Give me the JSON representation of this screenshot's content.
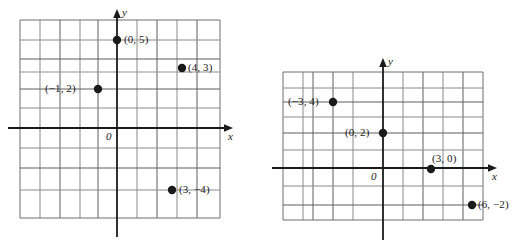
{
  "figure": {
    "type": "coordinate-plane-pair",
    "background": "#ffffff",
    "grid_color": "#6b6b6b",
    "axis_color": "#1a1a1a",
    "point_color": "#1a1a1a"
  },
  "graphs": [
    {
      "id": "left-graph",
      "name": "coordinate-plane-left",
      "origin_label": "0",
      "x_axis_label": "x",
      "y_axis_label": "y",
      "x_range": [
        -5,
        5
      ],
      "y_range": [
        -5,
        5
      ],
      "grid": {
        "spacing": 20,
        "left": 20,
        "top": 20,
        "right": 220,
        "bottom": 218,
        "cols": 10,
        "rows": 10
      },
      "axes": {
        "x_pixel": 117,
        "y_pixel": 128
      },
      "points": [
        {
          "label": "(0, 5)",
          "x": 0,
          "y": 5,
          "px": 117,
          "py": 40,
          "label_side": "right"
        },
        {
          "label": "(4, 3)",
          "x": 4,
          "y": 3,
          "px": 182,
          "py": 68,
          "label_side": "right"
        },
        {
          "label": "(−1, 2)",
          "x": -1,
          "y": 2,
          "px": 98,
          "py": 89,
          "label_side": "left"
        },
        {
          "label": "(3, −4)",
          "x": 3,
          "y": -4,
          "px": 172,
          "py": 190,
          "label_side": "right"
        }
      ]
    },
    {
      "id": "right-graph",
      "name": "coordinate-plane-right",
      "origin_label": "0",
      "x_axis_label": "x",
      "y_axis_label": "y",
      "x_range": [
        -5,
        5
      ],
      "y_range": [
        -4,
        4
      ],
      "grid": {
        "spacing": 20,
        "left": 283,
        "top": 72,
        "right": 483,
        "bottom": 220,
        "cols": 10,
        "rows": 7
      },
      "axes": {
        "x_pixel": 383,
        "y_pixel": 168
      },
      "points": [
        {
          "label": "(−3, 4)",
          "x": -3,
          "y": 4,
          "px": 333,
          "py": 102,
          "label_side": "left"
        },
        {
          "label": "(0, 2)",
          "x": 0,
          "y": 2,
          "px": 383,
          "py": 133,
          "label_side": "left"
        },
        {
          "label": "(3, 0)",
          "x": 3,
          "y": 0,
          "px": 431,
          "py": 169,
          "label_side": "above"
        },
        {
          "label": "(6, −2)",
          "x": 6,
          "y": -2,
          "px": 472,
          "py": 205,
          "label_side": "right"
        }
      ]
    }
  ]
}
